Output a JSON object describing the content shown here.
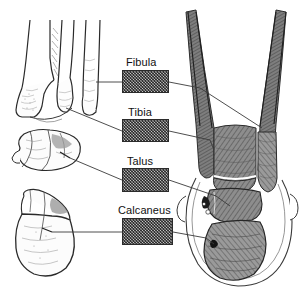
{
  "figure": {
    "background_color": "#ffffff",
    "width": 299,
    "height": 295
  },
  "labels": [
    {
      "id": "fibula",
      "text": "Fibula",
      "text_x": 126,
      "text_y": 56,
      "box": {
        "x": 122,
        "y": 70,
        "w": 47,
        "h": 23
      }
    },
    {
      "id": "tibia",
      "text": "Tibia",
      "text_x": 128,
      "text_y": 106,
      "box": {
        "x": 122,
        "y": 119,
        "w": 47,
        "h": 23
      }
    },
    {
      "id": "talus",
      "text": "Talus",
      "text_x": 127,
      "text_y": 155,
      "box": {
        "x": 122,
        "y": 168,
        "w": 47,
        "h": 24
      }
    },
    {
      "id": "calcaneus",
      "text": "Calcaneus",
      "text_x": 118,
      "text_y": 204,
      "box": {
        "x": 122,
        "y": 218,
        "w": 51,
        "h": 27
      }
    }
  ],
  "illustrations": [
    {
      "id": "ankle-joint-drawing",
      "name": "ankle-joint-line-drawing",
      "description": "Line drawing of distal tibia and fibula with medial and lateral malleoli, anterior and lateral views",
      "region": {
        "x": 4,
        "y": 18,
        "w": 100,
        "h": 98
      }
    },
    {
      "id": "talus-drawing",
      "name": "talus-bone-line-drawing",
      "description": "Isolated talus bone line drawing",
      "region": {
        "x": 8,
        "y": 128,
        "w": 80,
        "h": 55
      }
    },
    {
      "id": "calcaneus-drawing",
      "name": "calcaneus-bone-line-drawing",
      "description": "Isolated calcaneus (heel bone) line drawing",
      "region": {
        "x": 10,
        "y": 190,
        "w": 78,
        "h": 90
      }
    },
    {
      "id": "radiograph",
      "name": "ankle-radiograph",
      "description": "Anteroposterior ankle radiograph showing tibia, fibula, talus and calcaneus with soft tissue outline",
      "region": {
        "x": 170,
        "y": 8,
        "w": 128,
        "h": 284
      }
    }
  ],
  "leader_lines": {
    "color": "#3a3a3a",
    "count": 8,
    "description": "Thin lines linking each labelled swatch to the matching bone in the left drawings and the right radiograph"
  },
  "colors": {
    "ink": "#1a1a1a",
    "line": "#3a3a3a",
    "swatch_fill": "#9a9a9a",
    "swatch_border": "#2b2b2b",
    "bone_shade": "#6e6e6e",
    "soft_tissue": "#ffffff"
  }
}
